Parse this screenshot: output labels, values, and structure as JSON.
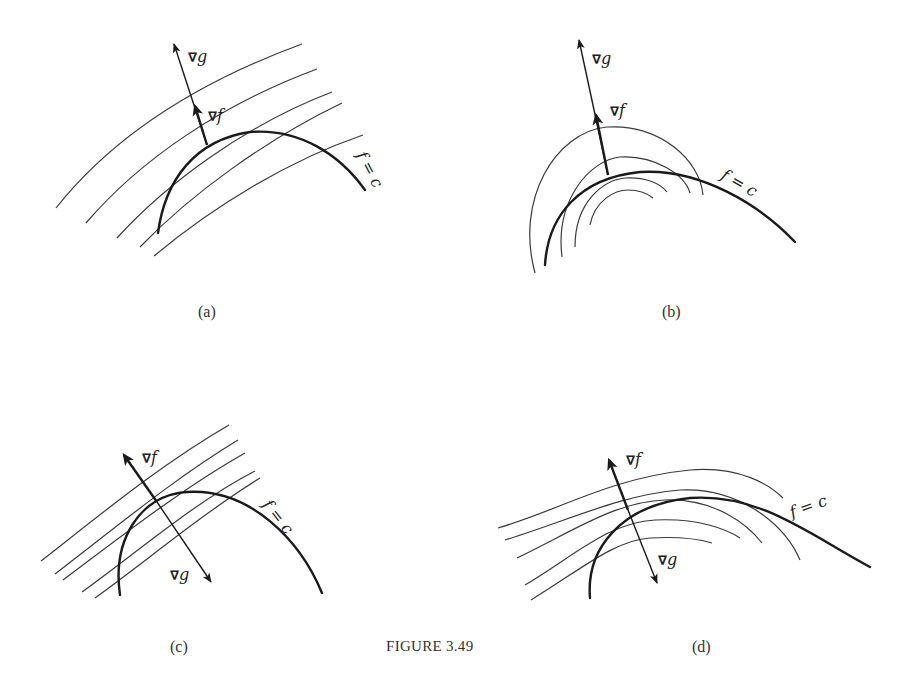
{
  "figure": {
    "caption": "Figure 3.49",
    "caption_small_caps": "FIGURE 3.49"
  },
  "panels": [
    {
      "id": "a",
      "label": "(a)",
      "grad_g": "g",
      "grad_f": "f",
      "curve_label": "f = c",
      "level_curves": "parallel lines",
      "vectors_direction": "same"
    },
    {
      "id": "b",
      "label": "(b)",
      "grad_g": "g",
      "grad_f": "f",
      "curve_label": "f = c",
      "level_curves": "concentric arcs",
      "vectors_direction": "same"
    },
    {
      "id": "c",
      "label": "(c)",
      "grad_g": "g",
      "grad_f": "f",
      "curve_label": "f = c",
      "level_curves": "parallel lines",
      "vectors_direction": "opposite"
    },
    {
      "id": "d",
      "label": "(d)",
      "grad_g": "g",
      "grad_f": "f",
      "curve_label": "f = c",
      "level_curves": "curved bands",
      "vectors_direction": "opposite"
    }
  ],
  "symbols": {
    "nabla": "∇",
    "f": "f",
    "g": "g",
    "eq": "=",
    "c": "c"
  },
  "colors": {
    "ink": "#1a1a1a",
    "thin_ink": "#3a3a3a",
    "background": "#ffffff"
  }
}
